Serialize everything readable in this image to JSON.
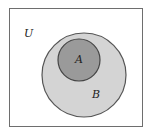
{
  "diagram": {
    "type": "venn",
    "universe_label": "U",
    "sets": [
      {
        "label": "A",
        "fill": "#9a9a9a",
        "relation": "subset of B"
      },
      {
        "label": "B",
        "fill": "#d4d4d4"
      }
    ],
    "colors": {
      "background": "#ffffff",
      "border": "#6e6e6e",
      "circle_stroke": "#555555"
    }
  }
}
